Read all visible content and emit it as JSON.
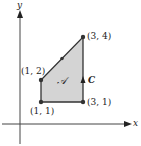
{
  "diagram": {
    "type": "region-in-plane",
    "axes": {
      "x_label": "x",
      "y_label": "y"
    },
    "region": {
      "label": "𝒜",
      "fill": "#d4d4d4",
      "edge_color": "#333333"
    },
    "curve": {
      "label": "C",
      "orientation": "counterclockwise"
    },
    "vertices": [
      {
        "label": "(1, 1)",
        "x": 1,
        "y": 1
      },
      {
        "label": "(3, 1)",
        "x": 3,
        "y": 1
      },
      {
        "label": "(3, 4)",
        "x": 3,
        "y": 4
      },
      {
        "label": "(1, 2)",
        "x": 1,
        "y": 2
      }
    ]
  }
}
